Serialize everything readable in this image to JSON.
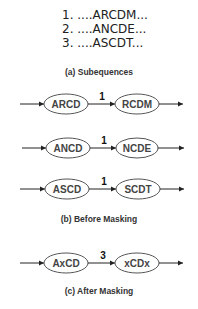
{
  "panel_a": {
    "subsequences": [
      "1. ....ARCDM...",
      "2. ....ANCDE...",
      "3. ....ASCDT..."
    ],
    "caption": "(a) Subequences"
  },
  "panel_b": {
    "rows": [
      {
        "from": "ARCD",
        "weight": "1",
        "to": "RCDM"
      },
      {
        "from": "ANCD",
        "weight": "1",
        "to": "NCDE"
      },
      {
        "from": "ASCD",
        "weight": "1",
        "to": "SCDT"
      }
    ],
    "caption": "(b) Before Masking"
  },
  "panel_c": {
    "row": {
      "from": "AxCD",
      "weight": "3",
      "to": "xCDx"
    },
    "caption": "(c) After Masking"
  }
}
